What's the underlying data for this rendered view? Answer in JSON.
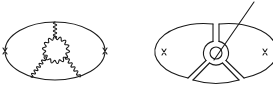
{
  "figure": {
    "left_diagram": {
      "type": "feynman-diagram",
      "outer_loop": {
        "shape": "ellipse",
        "cx": 55,
        "cy": 51,
        "rx": 50,
        "ry": 29
      },
      "vertex_crosses": [
        {
          "x": 5,
          "y": 51
        },
        {
          "x": 105,
          "y": 51
        }
      ],
      "inner_loop": {
        "shape": "wavy-circle",
        "cx": 56,
        "cy": 50,
        "r": 12
      },
      "wavy_propagators": [
        {
          "from": [
            55,
            38
          ],
          "to": [
            55,
            22
          ]
        },
        {
          "from": [
            46,
            57
          ],
          "to": [
            31,
            77
          ]
        },
        {
          "from": [
            66,
            57
          ],
          "to": [
            80,
            77
          ]
        }
      ]
    },
    "right_diagram": {
      "type": "feynman-diagram-double-line",
      "outer_loop": {
        "shape": "ellipse",
        "cx": 216,
        "cy": 51,
        "rx": 49,
        "ry": 28
      },
      "vertex_crosses": [
        {
          "x": 164,
          "y": 52
        },
        {
          "x": 265,
          "y": 52
        }
      ],
      "inner_circles": [
        {
          "cx": 216,
          "cy": 53,
          "r": 12
        },
        {
          "cx": 216,
          "cy": 53,
          "r": 6
        }
      ],
      "channels": [
        "up",
        "down-left",
        "down-right"
      ],
      "pointer_line": {
        "from": [
          254,
          2
        ],
        "to": [
          214,
          60
        ]
      }
    },
    "stroke_color": "#1a1a1a",
    "background_color": "#ffffff"
  }
}
